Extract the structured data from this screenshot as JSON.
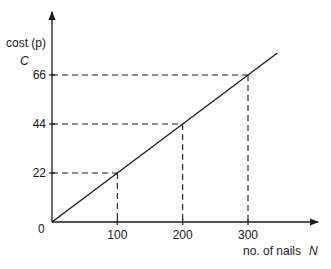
{
  "chart_data": {
    "type": "line",
    "title": "",
    "xlabel": "no. of nails",
    "xlabel_symbol": "N",
    "ylabel": "cost (p)",
    "ylabel_symbol": "C",
    "origin_label": "0",
    "x_ticks": [
      100,
      200,
      300
    ],
    "y_ticks": [
      22,
      44,
      66
    ],
    "x_tick_labels": [
      "100",
      "200",
      "300"
    ],
    "y_tick_labels": [
      "22",
      "44",
      "66"
    ],
    "series": [
      {
        "name": "C vs N",
        "x": [
          0,
          100,
          200,
          300
        ],
        "y": [
          0,
          22,
          44,
          66
        ]
      }
    ],
    "guides": [
      {
        "x": 100,
        "y": 22
      },
      {
        "x": 200,
        "y": 44
      },
      {
        "x": 300,
        "y": 66
      }
    ],
    "xlim": [
      0,
      370
    ],
    "ylim": [
      0,
      90
    ],
    "grid": false,
    "legend": "none",
    "colors": {
      "line": "#1a1a1a",
      "axis": "#1a1a1a",
      "background": "#ffffff"
    }
  }
}
